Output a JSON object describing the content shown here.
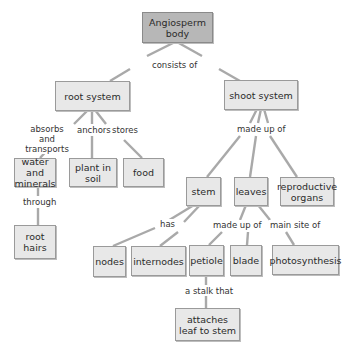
{
  "diagram": {
    "type": "concept-map",
    "colors": {
      "root_fill": "#b7b7b7",
      "node_fill": "#e8e8e8",
      "border": "#9a9a9a",
      "connector": "#a9a9a9"
    },
    "nodes": {
      "angiosperm": "Angiosperm body",
      "root_system": "root system",
      "shoot_system": "shoot system",
      "water_minerals": "water and minerals",
      "plant_in_soil": "plant in soil",
      "food": "food",
      "root_hairs": "root hairs",
      "stem": "stem",
      "leaves": "leaves",
      "reproductive_organs": "reproductive organs",
      "nodes": "nodes",
      "internodes": "internodes",
      "petiole": "petiole",
      "blade": "blade",
      "photosynthesis": "photosynthesis",
      "attaches_leaf": "attaches leaf to stem"
    },
    "links": {
      "consists_of": "consists of",
      "absorbs_transports": "absorbs and transports",
      "anchors": "anchors",
      "stores": "stores",
      "through": "through",
      "made_up_of_shoot": "made up of",
      "has": "has",
      "made_up_of_leaves": "made up of",
      "main_site_of": "main site of",
      "a_stalk_that": "a stalk that"
    },
    "edges": [
      [
        "angiosperm",
        "consists_of",
        "root_system"
      ],
      [
        "angiosperm",
        "consists_of",
        "shoot_system"
      ],
      [
        "root_system",
        "absorbs_transports",
        "water_minerals"
      ],
      [
        "root_system",
        "anchors",
        "plant_in_soil"
      ],
      [
        "root_system",
        "stores",
        "food"
      ],
      [
        "water_minerals",
        "through",
        "root_hairs"
      ],
      [
        "shoot_system",
        "made_up_of_shoot",
        "stem"
      ],
      [
        "shoot_system",
        "made_up_of_shoot",
        "leaves"
      ],
      [
        "shoot_system",
        "made_up_of_shoot",
        "reproductive_organs"
      ],
      [
        "stem",
        "has",
        "nodes"
      ],
      [
        "stem",
        "has",
        "internodes"
      ],
      [
        "leaves",
        "made_up_of_leaves",
        "petiole"
      ],
      [
        "leaves",
        "made_up_of_leaves",
        "blade"
      ],
      [
        "leaves",
        "main_site_of",
        "photosynthesis"
      ],
      [
        "petiole",
        "a_stalk_that",
        "attaches_leaf"
      ]
    ]
  }
}
